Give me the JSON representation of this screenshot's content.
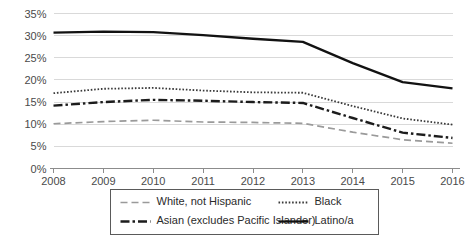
{
  "chart_data": {
    "type": "line",
    "title": "",
    "subtitle": "",
    "xlabel": "",
    "ylabel": "",
    "categories": [
      "2008",
      "2009",
      "2010",
      "2011",
      "2012",
      "2013",
      "2014",
      "2015",
      "2016"
    ],
    "x": [
      2008,
      2009,
      2010,
      2011,
      2012,
      2013,
      2014,
      2015,
      2016
    ],
    "ylim": [
      0,
      35
    ],
    "xlim": [
      2008,
      2016
    ],
    "y_tick_labels": [
      "0%",
      "5%",
      "10%",
      "15%",
      "20%",
      "25%",
      "30%",
      "35%"
    ],
    "y_tick_values": [
      0,
      5,
      10,
      15,
      20,
      25,
      30,
      35
    ],
    "grid": true,
    "grid_axis": "y",
    "legend_position": "bottom",
    "value_suffix": "%",
    "series": [
      {
        "name": "White, not Hispanic",
        "key": "white",
        "values": [
          10.1,
          10.6,
          10.9,
          10.5,
          10.4,
          10.2,
          8.2,
          6.5,
          5.7
        ],
        "color": "#9a9a9a",
        "style": "dashed",
        "dash_array": "7,4",
        "width": 1.7
      },
      {
        "name": "Black",
        "key": "black",
        "values": [
          17.0,
          18.0,
          18.2,
          17.6,
          17.2,
          17.1,
          14.1,
          11.3,
          9.9
        ],
        "color": "#3a3a3a",
        "style": "dotted",
        "dash_array": "1.6,1.8",
        "width": 1.8
      },
      {
        "name": "Asian (excludes Pacific Islander)",
        "key": "asian",
        "values": [
          14.2,
          15.0,
          15.5,
          15.3,
          15.0,
          14.8,
          11.4,
          8.1,
          6.9
        ],
        "color": "#1c1c1c",
        "style": "dash-dot",
        "dash_array": "9,3,2.5,3",
        "width": 2.4
      },
      {
        "name": "Latino/a",
        "key": "latino",
        "values": [
          30.7,
          30.9,
          30.8,
          30.1,
          29.3,
          28.6,
          23.8,
          19.5,
          18.1
        ],
        "color": "#121212",
        "style": "solid",
        "dash_array": "none",
        "width": 2.3
      }
    ]
  },
  "legend": {
    "entries": [
      {
        "label": "White, not Hispanic",
        "series_key": "white"
      },
      {
        "label": "Black",
        "series_key": "black"
      },
      {
        "label": "Asian (excludes Pacific Islander)",
        "series_key": "asian"
      },
      {
        "label": "Latino/a",
        "series_key": "latino"
      }
    ]
  },
  "colors": {
    "background": "#ffffff",
    "gridline": "#d9d9d9",
    "axis": "#8c8c8c",
    "tick_text": "#4a4a4a",
    "legend_border": "#5a5a5a"
  }
}
